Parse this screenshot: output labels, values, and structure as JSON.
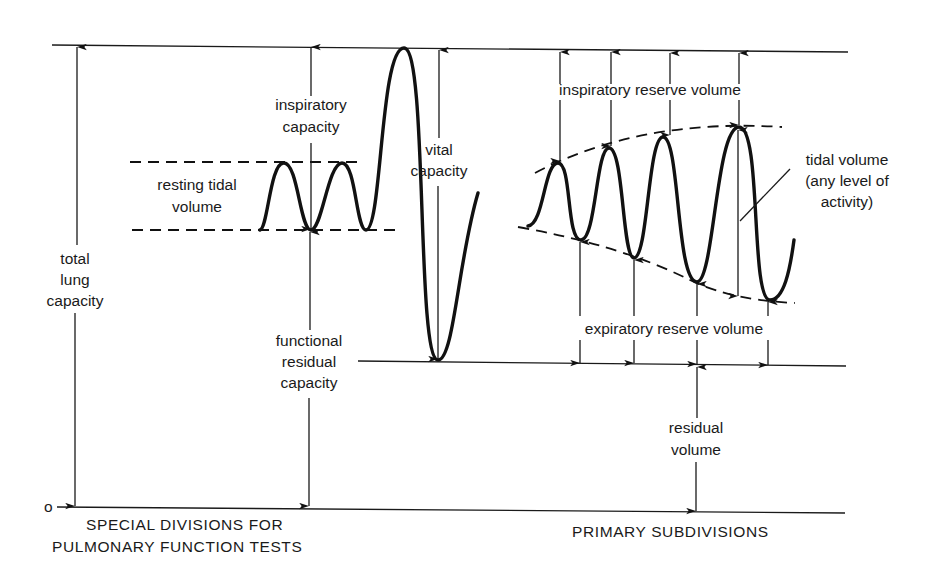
{
  "diagram": {
    "zero_label": "o",
    "left_section": {
      "heading_line1": "SPECIAL DIVISIONS FOR",
      "heading_line2": "PULMONARY FUNCTION TESTS",
      "labels": {
        "total_lung_capacity": [
          "total",
          "lung",
          "capacity"
        ],
        "inspiratory_capacity": [
          "inspiratory",
          "capacity"
        ],
        "resting_tidal_volume": [
          "resting tidal",
          "volume"
        ],
        "vital_capacity": [
          "vital",
          "capacity"
        ],
        "functional_residual_capacity": [
          "functional",
          "residual",
          "capacity"
        ]
      }
    },
    "right_section": {
      "heading": "PRIMARY SUBDIVISIONS",
      "labels": {
        "inspiratory_reserve_volume": "inspiratory reserve volume",
        "tidal_volume": [
          "tidal volume",
          "(any level of",
          "activity)"
        ],
        "expiratory_reserve_volume": "expiratory reserve volume",
        "residual_volume": [
          "residual",
          "volume"
        ]
      }
    },
    "colors": {
      "ink": "#1a1a1a",
      "background": "#ffffff"
    }
  }
}
